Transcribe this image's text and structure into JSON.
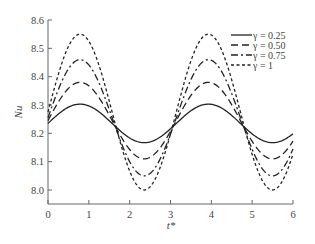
{
  "chart_data": {
    "type": "line",
    "title": "",
    "xlabel": "t*",
    "ylabel": "Nu",
    "xlim": [
      0,
      6
    ],
    "ylim": [
      7.95,
      8.6
    ],
    "xticks": [
      0,
      1,
      2,
      3,
      4,
      5,
      6
    ],
    "yticks": [
      8.0,
      8.1,
      8.2,
      8.3,
      8.4,
      8.5,
      8.6
    ],
    "xtick_labels": [
      "0",
      "1",
      "2",
      "3",
      "4",
      "5",
      "6"
    ],
    "ytick_labels": [
      "8.0",
      "8.1",
      "8.2",
      "8.3",
      "8.4",
      "8.5",
      "8.6"
    ],
    "grid": false,
    "legend_position": "upper right",
    "model": "Nu = mean + amp * sin(2 t*)",
    "series": [
      {
        "name": "γ = 0.25",
        "label": "γ = 0.25",
        "style": "solid",
        "mean": 8.235,
        "amp": 0.068,
        "x": [
          0,
          0.785,
          1.571,
          2.356,
          3.142,
          3.927,
          4.712,
          5.498,
          6.0
        ],
        "values": [
          8.235,
          8.303,
          8.235,
          8.167,
          8.235,
          8.303,
          8.235,
          8.167,
          8.216
        ]
      },
      {
        "name": "γ = 0.50",
        "label": "γ = 0.50",
        "style": "dashed",
        "mean": 8.245,
        "amp": 0.135,
        "x": [
          0,
          0.785,
          1.571,
          2.356,
          3.142,
          3.927,
          4.712,
          5.498,
          6.0
        ],
        "values": [
          8.245,
          8.38,
          8.245,
          8.11,
          8.245,
          8.38,
          8.245,
          8.11,
          8.207
        ]
      },
      {
        "name": "γ = 0.75",
        "label": "γ = 0.75",
        "style": "dashdot",
        "mean": 8.255,
        "amp": 0.205,
        "x": [
          0,
          0.785,
          1.571,
          2.356,
          3.142,
          3.927,
          4.712,
          5.498,
          6.0
        ],
        "values": [
          8.255,
          8.46,
          8.255,
          8.05,
          8.255,
          8.46,
          8.255,
          8.05,
          8.198
        ]
      },
      {
        "name": "γ = 1",
        "label": "γ = 1",
        "style": "dotted-dash",
        "mean": 8.275,
        "amp": 0.275,
        "x": [
          0,
          0.785,
          1.571,
          2.356,
          3.142,
          3.927,
          4.712,
          5.498,
          6.0
        ],
        "values": [
          8.275,
          8.55,
          8.275,
          8.0,
          8.275,
          8.55,
          8.275,
          8.0,
          8.198
        ]
      }
    ]
  }
}
